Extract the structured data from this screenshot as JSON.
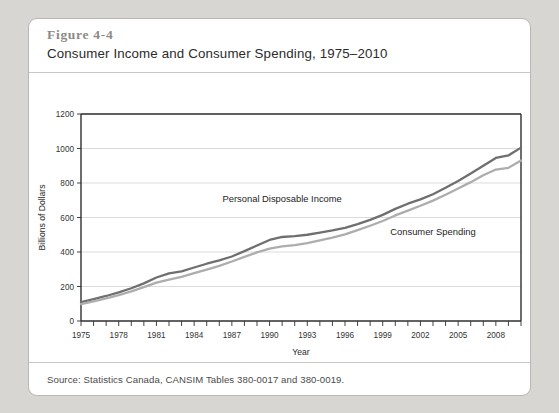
{
  "figure": {
    "number": "Figure 4-4",
    "title": "Consumer Income and Consumer Spending, 1975–2010",
    "source": "Source: Statistics Canada, CANSIM Tables 380-0017 and 380-0019."
  },
  "chart_data": {
    "type": "line",
    "title": "Consumer Income and Consumer Spending, 1975–2010",
    "xlabel": "Year",
    "ylabel": "Billions of Dollars",
    "xlim": [
      1975,
      2010
    ],
    "ylim": [
      0,
      1200
    ],
    "yticks": [
      0,
      200,
      400,
      600,
      800,
      1000,
      1200
    ],
    "xticks_labeled": [
      1975,
      1978,
      1981,
      1984,
      1987,
      1990,
      1993,
      1996,
      1999,
      2002,
      2005,
      2008
    ],
    "xtick_step": 1,
    "grid": true,
    "legend": "inline-annotations",
    "x": [
      1975,
      1976,
      1977,
      1978,
      1979,
      1980,
      1981,
      1982,
      1983,
      1984,
      1985,
      1986,
      1987,
      1988,
      1989,
      1990,
      1991,
      1992,
      1993,
      1994,
      1995,
      1996,
      1997,
      1998,
      1999,
      2000,
      2001,
      2002,
      2003,
      2004,
      2005,
      2006,
      2007,
      2008,
      2009,
      2010
    ],
    "series": [
      {
        "name": "Personal Disposable Income",
        "color": "#6f6f6f",
        "label_x": 1991,
        "label_y": 690,
        "values": [
          110,
          127,
          145,
          166,
          190,
          218,
          252,
          276,
          288,
          310,
          332,
          351,
          374,
          405,
          438,
          470,
          487,
          492,
          500,
          512,
          525,
          540,
          562,
          586,
          615,
          650,
          680,
          705,
          735,
          772,
          812,
          855,
          900,
          945,
          960,
          1005
        ]
      },
      {
        "name": "Consumer Spending",
        "color": "#adadad",
        "label_x": 2003,
        "label_y": 500,
        "values": [
          98,
          114,
          131,
          150,
          172,
          196,
          222,
          240,
          256,
          277,
          298,
          320,
          345,
          372,
          398,
          420,
          432,
          440,
          452,
          468,
          484,
          502,
          527,
          552,
          580,
          612,
          640,
          668,
          698,
          732,
          768,
          805,
          845,
          878,
          888,
          930
        ]
      }
    ]
  }
}
